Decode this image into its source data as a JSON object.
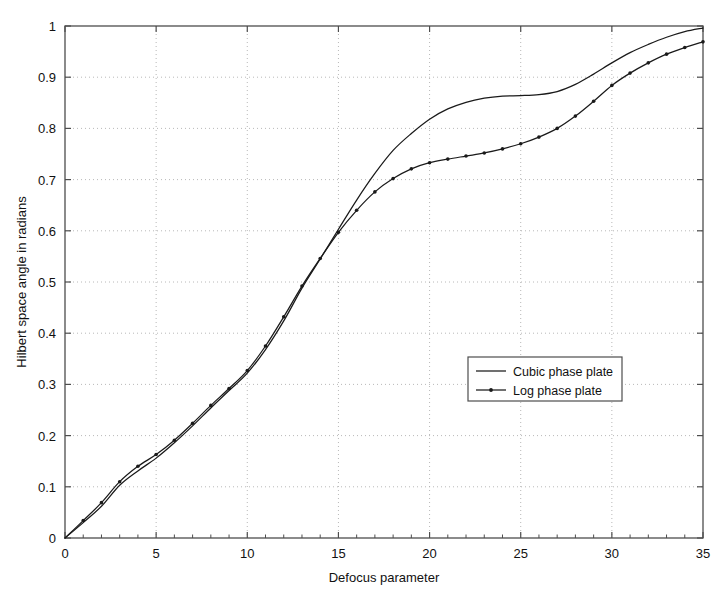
{
  "chart_data": {
    "type": "line",
    "title": "",
    "xlabel": "Defocus parameter",
    "ylabel": "Hilbert space angle in radians",
    "xlim": [
      0,
      35
    ],
    "ylim": [
      0,
      1
    ],
    "xticks": [
      0,
      5,
      10,
      15,
      20,
      25,
      30,
      35
    ],
    "yticks": [
      0,
      0.1,
      0.2,
      0.3,
      0.4,
      0.5,
      0.6,
      0.7,
      0.8,
      0.9,
      1
    ],
    "xtick_labels": [
      "0",
      "5",
      "10",
      "15",
      "20",
      "25",
      "30",
      "35"
    ],
    "ytick_labels": [
      "0",
      "0.1",
      "0.2",
      "0.3",
      "0.4",
      "0.5",
      "0.6",
      "0.7",
      "0.8",
      "0.9",
      "1"
    ],
    "grid": true,
    "grid_style": "dotted",
    "legend_position": "center-right",
    "line_color": "#1a1a1a",
    "grid_color": "#b0b0b0",
    "axis_color": "#4d4d4d",
    "x": [
      0,
      1,
      2,
      3,
      4,
      5,
      6,
      7,
      8,
      9,
      10,
      11,
      12,
      13,
      14,
      15,
      16,
      17,
      18,
      19,
      20,
      21,
      22,
      23,
      24,
      25,
      26,
      27,
      28,
      29,
      30,
      31,
      32,
      33,
      34,
      35
    ],
    "series": [
      {
        "name": "Cubic phase plate",
        "marker": "none",
        "linestyle": "solid",
        "values": [
          0.0,
          0.03,
          0.062,
          0.103,
          0.131,
          0.156,
          0.186,
          0.219,
          0.254,
          0.288,
          0.322,
          0.368,
          0.424,
          0.488,
          0.545,
          0.603,
          0.66,
          0.712,
          0.757,
          0.79,
          0.818,
          0.838,
          0.851,
          0.859,
          0.863,
          0.864,
          0.866,
          0.872,
          0.886,
          0.906,
          0.928,
          0.948,
          0.964,
          0.978,
          0.989,
          0.996
        ]
      },
      {
        "name": "Log phase plate",
        "marker": "dot",
        "linestyle": "solid",
        "values": [
          0.0,
          0.034,
          0.069,
          0.11,
          0.14,
          0.163,
          0.191,
          0.224,
          0.259,
          0.292,
          0.327,
          0.375,
          0.432,
          0.492,
          0.546,
          0.597,
          0.64,
          0.676,
          0.702,
          0.721,
          0.733,
          0.74,
          0.746,
          0.752,
          0.76,
          0.77,
          0.783,
          0.8,
          0.824,
          0.853,
          0.884,
          0.908,
          0.928,
          0.945,
          0.958,
          0.969
        ]
      }
    ]
  },
  "legend": {
    "entries": [
      {
        "label": "Cubic phase plate"
      },
      {
        "label": "Log phase plate"
      }
    ]
  }
}
